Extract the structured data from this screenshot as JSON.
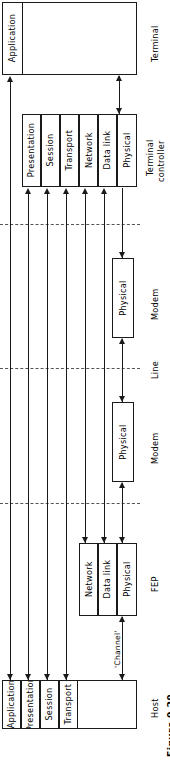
{
  "figure": {
    "caption": "Figure 9.20",
    "title_label": "Figure 9.20"
  },
  "nodes": {
    "terminal": {
      "name": "Terminal",
      "layers": [
        "Application"
      ]
    },
    "terminal_controller": {
      "name": "Terminal controller",
      "name_line1": "Terminal",
      "name_line2": "controller",
      "layers": [
        "Presentation",
        "Session",
        "Transport",
        "Network",
        "Data link",
        "Physical"
      ]
    },
    "modem_upper": {
      "name": "Modem",
      "layers": [
        "Physical"
      ]
    },
    "modem_lower": {
      "name": "Modem",
      "layers": [
        "Physical"
      ]
    },
    "fep": {
      "name": "FEP",
      "layers": [
        "Network",
        "Data link",
        "Physical"
      ]
    },
    "host": {
      "name": "Host",
      "layers": [
        "Application",
        "Presentation",
        "Session",
        "Transport"
      ]
    }
  },
  "links": {
    "line": "Line",
    "channel": "'Channel'"
  },
  "colors": {
    "stroke": "#1a1a1a",
    "dashed": "#555555",
    "background": "#ffffff"
  }
}
